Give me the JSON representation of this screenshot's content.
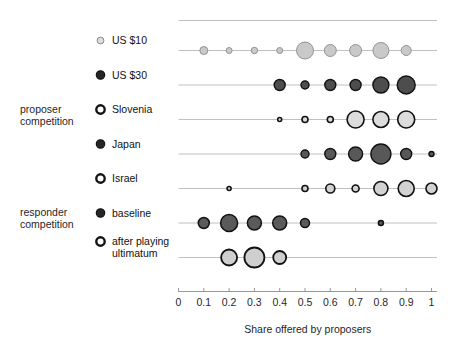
{
  "chart_data": {
    "type": "scatter",
    "title": "",
    "xlabel": "Share offered by proposers",
    "ylabel": "",
    "xlim": [
      0,
      1.06
    ],
    "xticks": [
      0,
      0.1,
      0.2,
      0.3,
      0.4,
      0.5,
      0.6,
      0.7,
      0.8,
      0.9,
      1
    ],
    "xtick_labels": [
      "0",
      "0.1",
      "0.2",
      "0.3",
      "0.4",
      "0.5",
      "0.6",
      "0.7",
      "0.8",
      "0.9",
      "1"
    ],
    "grid": false,
    "legend_position": "left-inline",
    "size_encodes": "relative frequency of offers (bubble area)",
    "group_labels": [
      {
        "id": "proposer-competition",
        "text": "proposer\ncompetition",
        "line1": "proposer",
        "line2": "competition"
      },
      {
        "id": "responder-competition",
        "text": "responder\ncompetition",
        "line1": "responder",
        "line2": "competition"
      }
    ],
    "series": [
      {
        "name": "US $10",
        "label_line1": "US $10",
        "label_line2": "",
        "group": "proposer competition",
        "marker_fill": "#c9c9c9",
        "marker_stroke": "#8a8a8a",
        "marker_stroke_width": 0.9,
        "x": [
          0.1,
          0.2,
          0.3,
          0.4,
          0.5,
          0.6,
          0.7,
          0.8,
          0.9
        ],
        "sizes": [
          8,
          6,
          6.5,
          6,
          17,
          12,
          12,
          16,
          10
        ]
      },
      {
        "name": "US $30",
        "label_line1": "US $30",
        "label_line2": "",
        "group": "proposer competition",
        "marker_fill": "#4d4d4d",
        "marker_stroke": "#111111",
        "marker_stroke_width": 1.4,
        "x": [
          0.4,
          0.5,
          0.6,
          0.7,
          0.8,
          0.9
        ],
        "sizes": [
          11,
          8,
          11,
          11,
          16,
          18
        ]
      },
      {
        "name": "Slovenia",
        "label_line1": "Slovenia",
        "label_line2": "",
        "group": "proposer competition",
        "marker_fill": "#dcdcdc",
        "marker_stroke": "#111111",
        "marker_stroke_width": 1.6,
        "x": [
          0.4,
          0.5,
          0.6,
          0.7,
          0.8,
          0.9
        ],
        "sizes": [
          4,
          6,
          6,
          17,
          16,
          17
        ]
      },
      {
        "name": "Japan",
        "label_line1": "Japan",
        "label_line2": "",
        "group": "proposer competition",
        "marker_fill": "#585858",
        "marker_stroke": "#111111",
        "marker_stroke_width": 1.4,
        "x": [
          0.5,
          0.6,
          0.7,
          0.8,
          0.9,
          1.0
        ],
        "sizes": [
          8,
          11,
          14,
          20,
          11,
          5
        ]
      },
      {
        "name": "Israel",
        "label_line1": "Israel",
        "label_line2": "",
        "group": "proposer competition",
        "marker_fill": "#d2d2d2",
        "marker_stroke": "#111111",
        "marker_stroke_width": 1.6,
        "x": [
          0.2,
          0.5,
          0.6,
          0.7,
          0.8,
          0.9,
          1.0
        ],
        "sizes": [
          4,
          6,
          9,
          7,
          14,
          16,
          11
        ]
      },
      {
        "name": "baseline",
        "label_line1": "baseline",
        "label_line2": "",
        "group": "responder competition",
        "marker_fill": "#5a5a5a",
        "marker_stroke": "#111111",
        "marker_stroke_width": 1.5,
        "x": [
          0.1,
          0.2,
          0.3,
          0.4,
          0.5,
          0.8
        ],
        "sizes": [
          11,
          17,
          14,
          14,
          9,
          5
        ]
      },
      {
        "name": "after playing ultimatum",
        "label_line1": "after playing",
        "label_line2": "ultimatum",
        "group": "responder competition",
        "marker_fill": "#cfcfcf",
        "marker_stroke": "#111111",
        "marker_stroke_width": 1.8,
        "x": [
          0.2,
          0.3,
          0.4
        ],
        "sizes": [
          16,
          20,
          13
        ]
      }
    ]
  },
  "colors": {
    "background": "#ffffff",
    "rowline": "#b9b9b9",
    "axisline": "#8c8c8c",
    "text": "#1f1f1f"
  }
}
